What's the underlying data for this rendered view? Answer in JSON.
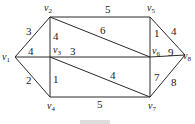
{
  "graph": {
    "vertices": [
      {
        "id": "v1",
        "label": "v",
        "sub": "1",
        "x": 15,
        "y": 57,
        "lx": 2,
        "ly": 60
      },
      {
        "id": "v2",
        "label": "v",
        "sub": "2",
        "x": 50,
        "y": 17,
        "lx": 44,
        "ly": 11
      },
      {
        "id": "v3",
        "label": "v",
        "sub": "3",
        "x": 50,
        "y": 57,
        "lx": 53,
        "ly": 53
      },
      {
        "id": "v4",
        "label": "v",
        "sub": "4",
        "x": 50,
        "y": 97,
        "lx": 47,
        "ly": 109
      },
      {
        "id": "v5",
        "label": "v",
        "sub": "5",
        "x": 150,
        "y": 17,
        "lx": 147,
        "ly": 11
      },
      {
        "id": "v6",
        "label": "v",
        "sub": "6",
        "x": 150,
        "y": 57,
        "lx": 152,
        "ly": 54
      },
      {
        "id": "v7",
        "label": "v",
        "sub": "7",
        "x": 150,
        "y": 97,
        "lx": 148,
        "ly": 109
      },
      {
        "id": "v8",
        "label": "v",
        "sub": "8",
        "x": 185,
        "y": 55,
        "lx": 183,
        "ly": 59
      }
    ],
    "edges": [
      {
        "from": "v1",
        "to": "v2",
        "weight": "3",
        "wx": 26,
        "wy": 35
      },
      {
        "from": "v1",
        "to": "v3",
        "weight": "4",
        "wx": 28,
        "wy": 55
      },
      {
        "from": "v1",
        "to": "v4",
        "weight": "2",
        "wx": 26,
        "wy": 84
      },
      {
        "from": "v2",
        "to": "v3",
        "weight": "4",
        "wx": 53,
        "wy": 40
      },
      {
        "from": "v3",
        "to": "v4",
        "weight": "1",
        "wx": 53,
        "wy": 83
      },
      {
        "from": "v2",
        "to": "v5",
        "weight": "5",
        "wx": 105,
        "wy": 13
      },
      {
        "from": "v2",
        "to": "v6",
        "weight": "6",
        "wx": 100,
        "wy": 34
      },
      {
        "from": "v3",
        "to": "v6",
        "weight": "3",
        "wx": 70,
        "wy": 55
      },
      {
        "from": "v3",
        "to": "v7",
        "weight": "4",
        "wx": 110,
        "wy": 79
      },
      {
        "from": "v4",
        "to": "v7",
        "weight": "5",
        "wx": 97,
        "wy": 108
      },
      {
        "from": "v5",
        "to": "v6",
        "weight": "1",
        "wx": 154,
        "wy": 37
      },
      {
        "from": "v5",
        "to": "v8",
        "weight": "4",
        "wx": 171,
        "wy": 35
      },
      {
        "from": "v6",
        "to": "v8",
        "weight": "9",
        "wx": 168,
        "wy": 56
      },
      {
        "from": "v6",
        "to": "v7",
        "weight": "7",
        "wx": 154,
        "wy": 81
      },
      {
        "from": "v7",
        "to": "v8",
        "weight": "8",
        "wx": 171,
        "wy": 86
      }
    ]
  }
}
